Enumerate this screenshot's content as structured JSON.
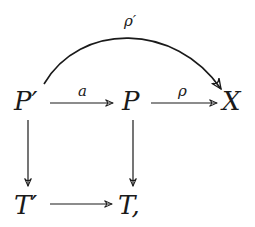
{
  "diagram": {
    "type": "commutative-diagram",
    "nodes": {
      "p_prime": "P′",
      "p": "P",
      "x": "X",
      "t_prime": "T′",
      "t": "T,"
    },
    "edges": [
      {
        "from": "P′",
        "to": "P",
        "label": "a"
      },
      {
        "from": "P",
        "to": "X",
        "label": "ρ"
      },
      {
        "from": "P′",
        "to": "X",
        "label": "ρ′",
        "curved": true
      },
      {
        "from": "P′",
        "to": "T′",
        "label": ""
      },
      {
        "from": "P",
        "to": "T",
        "label": ""
      },
      {
        "from": "T′",
        "to": "T",
        "label": ""
      }
    ],
    "labels": {
      "a": "a",
      "rho": "ρ",
      "rho_prime": "ρ′"
    },
    "colors": {
      "ink": "#1a1a1a",
      "background": "#ffffff"
    }
  }
}
